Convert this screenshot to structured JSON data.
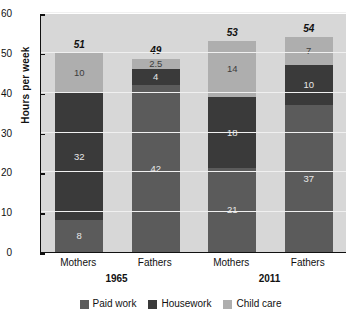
{
  "chart_data": {
    "type": "bar",
    "subtype": "stacked",
    "title": "",
    "xlabel": "",
    "ylabel": "Hours per week",
    "ylim": [
      0,
      60
    ],
    "yticks": [
      0,
      10,
      20,
      30,
      40,
      50,
      60
    ],
    "grid": true,
    "legend_position": "bottom",
    "categories": [
      "Mothers",
      "Fathers",
      "Mothers",
      "Fathers"
    ],
    "groups": [
      {
        "label": "1965",
        "categories": [
          "Mothers",
          "Fathers"
        ]
      },
      {
        "label": "2011",
        "categories": [
          "Mothers",
          "Fathers"
        ]
      }
    ],
    "series": [
      {
        "name": "Paid work",
        "color": "#5b5b5b",
        "values": [
          8,
          42,
          21,
          37
        ]
      },
      {
        "name": "Housework",
        "color": "#3a3a3a",
        "values": [
          32,
          4,
          18,
          10
        ]
      },
      {
        "name": "Child care",
        "color": "#aeaeae",
        "values": [
          10,
          2.5,
          14,
          7
        ]
      }
    ],
    "segment_labels": [
      [
        "8",
        "42",
        "21",
        "37"
      ],
      [
        "32",
        "4",
        "18",
        "10"
      ],
      [
        "10",
        "2.5",
        "14",
        "7"
      ]
    ],
    "totals": [
      "51",
      "49",
      "53",
      "54"
    ],
    "total_values": [
      51,
      49,
      53,
      54
    ],
    "colors": {
      "plot_background": "#d7d7d7",
      "gridline": "#f0f0f0",
      "axis": "#111111",
      "paid_work": "#5b5b5b",
      "housework": "#3a3a3a",
      "child_care": "#aeaeae",
      "page_background": "#ffffff"
    }
  },
  "axis": {
    "y_title": "Hours per week",
    "y_tick_labels": [
      "60",
      "50",
      "40",
      "30",
      "20",
      "10",
      "0"
    ]
  },
  "x_axis": {
    "labels": [
      "Mothers",
      "Fathers",
      "Mothers",
      "Fathers"
    ],
    "group_labels": [
      "1965",
      "2011"
    ]
  },
  "legend": {
    "items": [
      {
        "label": "Paid work"
      },
      {
        "label": "Housework"
      },
      {
        "label": "Child care"
      }
    ]
  },
  "bars": [
    {
      "total": "51",
      "paid": "8",
      "house": "32",
      "child": "10"
    },
    {
      "total": "49",
      "paid": "42",
      "house": "4",
      "child": "2.5"
    },
    {
      "total": "53",
      "paid": "21",
      "house": "18",
      "child": "14"
    },
    {
      "total": "54",
      "paid": "37",
      "house": "10",
      "child": "7"
    }
  ]
}
